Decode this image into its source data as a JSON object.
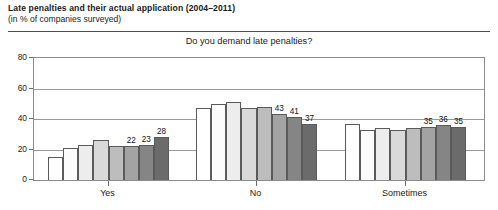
{
  "header": {
    "title": "Late penalties and their actual application (2004–2011)",
    "subtitle": "(in % of companies surveyed)"
  },
  "chart_data": {
    "type": "bar",
    "title": "Do you demand late penalties?",
    "xlabel": "",
    "ylabel": "",
    "ylim": [
      0,
      80
    ],
    "yticks": [
      0,
      20,
      40,
      60,
      80
    ],
    "ytick_labels": [
      "0",
      "20",
      "40",
      "60",
      "80"
    ],
    "grid": true,
    "legend": "none",
    "categories": [
      "Yes",
      "No",
      "Sometimes"
    ],
    "series": [
      {
        "name": "2004",
        "values": [
          15,
          47,
          37
        ]
      },
      {
        "name": "2005",
        "values": [
          21,
          50,
          33
        ]
      },
      {
        "name": "2006",
        "values": [
          23,
          51,
          34
        ]
      },
      {
        "name": "2007",
        "values": [
          26,
          47,
          33
        ]
      },
      {
        "name": "2008",
        "values": [
          22,
          48,
          34
        ]
      },
      {
        "name": "2009",
        "values": [
          22,
          43,
          35
        ]
      },
      {
        "name": "2010",
        "values": [
          23,
          41,
          36
        ]
      },
      {
        "name": "2011",
        "values": [
          28,
          37,
          35
        ]
      }
    ],
    "bar_colors": [
      "#ffffff",
      "#fbfbfb",
      "#ededed",
      "#d9d9d9",
      "#bdbdbd",
      "#a3a3a3",
      "#858585",
      "#6b6b6b"
    ],
    "data_labels": {
      "Yes": [
        "",
        "",
        "",
        "",
        "",
        "22",
        "23",
        "28"
      ],
      "No": [
        "",
        "",
        "",
        "",
        "",
        "43",
        "41",
        "37"
      ],
      "Sometimes": [
        "",
        "",
        "",
        "",
        "",
        "35",
        "36",
        "35"
      ]
    }
  }
}
